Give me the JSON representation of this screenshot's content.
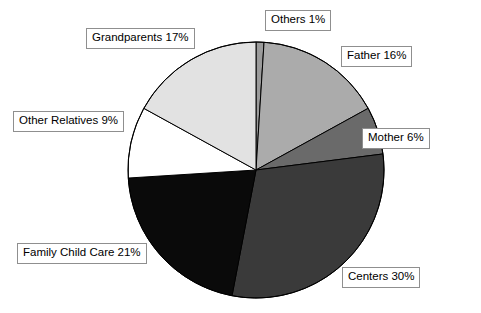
{
  "chart_data": {
    "type": "pie",
    "title": "",
    "subtitle": "",
    "xlabel": "",
    "ylabel": "",
    "legend_position": "none",
    "labels_position": "outside-boxed-callouts",
    "grid": false,
    "units": "percent",
    "total": 100,
    "start_angle_deg": 0,
    "direction": "clockwise",
    "categories": [
      "Others",
      "Father",
      "Mother",
      "Centers",
      "Family Child Care",
      "Other Relatives",
      "Grandparents"
    ],
    "values": [
      1,
      16,
      6,
      30,
      21,
      9,
      17
    ],
    "slices": [
      {
        "name": "Others",
        "value": 1,
        "label": "Others 1%",
        "color": "#9b9b9b"
      },
      {
        "name": "Father",
        "value": 16,
        "label": "Father 16%",
        "color": "#ababab"
      },
      {
        "name": "Mother",
        "value": 6,
        "label": "Mother 6%",
        "color": "#6a6a6a"
      },
      {
        "name": "Centers",
        "value": 30,
        "label": "Centers 30%",
        "color": "#3a3a3a"
      },
      {
        "name": "Family Child Care",
        "value": 21,
        "label": "Family Child Care 21%",
        "color": "#0a0a0a"
      },
      {
        "name": "Other Relatives",
        "value": 9,
        "label": "Other Relatives 9%",
        "color": "#ffffff"
      },
      {
        "name": "Grandparents",
        "value": 17,
        "label": "Grandparents 17%",
        "color": "#e2e2e2"
      }
    ],
    "geometry": {
      "center_x": 256,
      "center_y": 170,
      "radius": 128,
      "outline_color": "#000000",
      "background": "#ffffff"
    }
  }
}
